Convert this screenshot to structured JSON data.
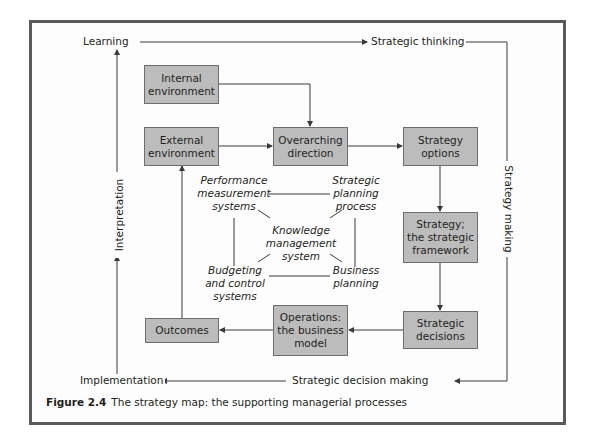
{
  "figure": {
    "caption_number": "Figure 2.4",
    "caption_text": "The strategy map: the supporting managerial processes"
  },
  "outer_loop": {
    "learning": "Learning",
    "strategic_thinking": "Strategic thinking",
    "strategy_making": "Strategy making",
    "strategic_decision_making": "Strategic decision making",
    "implementation": "Implementation",
    "interpretation": "Interpretation"
  },
  "boxes": {
    "internal_environment": "Internal\nenvironment",
    "external_environment": "External\nenvironment",
    "overarching_direction": "Overarching\ndirection",
    "strategy_options": "Strategy\noptions",
    "strategic_framework": "Strategy;\nthe strategic\nframework",
    "strategic_decisions": "Strategic\ndecisions",
    "operations": "Operations:\nthe business\nmodel",
    "outcomes": "Outcomes"
  },
  "processes": {
    "performance_measurement": "Performance\nmeasurement\nsystems",
    "strategic_planning": "Strategic\nplanning\nprocess",
    "knowledge_management": "Knowledge\nmanagement\nsystem",
    "budgeting_control": "Budgeting\nand control\nsystems",
    "business_planning": "Business\nplanning"
  },
  "colors": {
    "box_fill": "#bcbcbc",
    "box_border": "#6e6e6e",
    "frame_border": "#5a5a5a",
    "line": "#3a3a3a"
  }
}
